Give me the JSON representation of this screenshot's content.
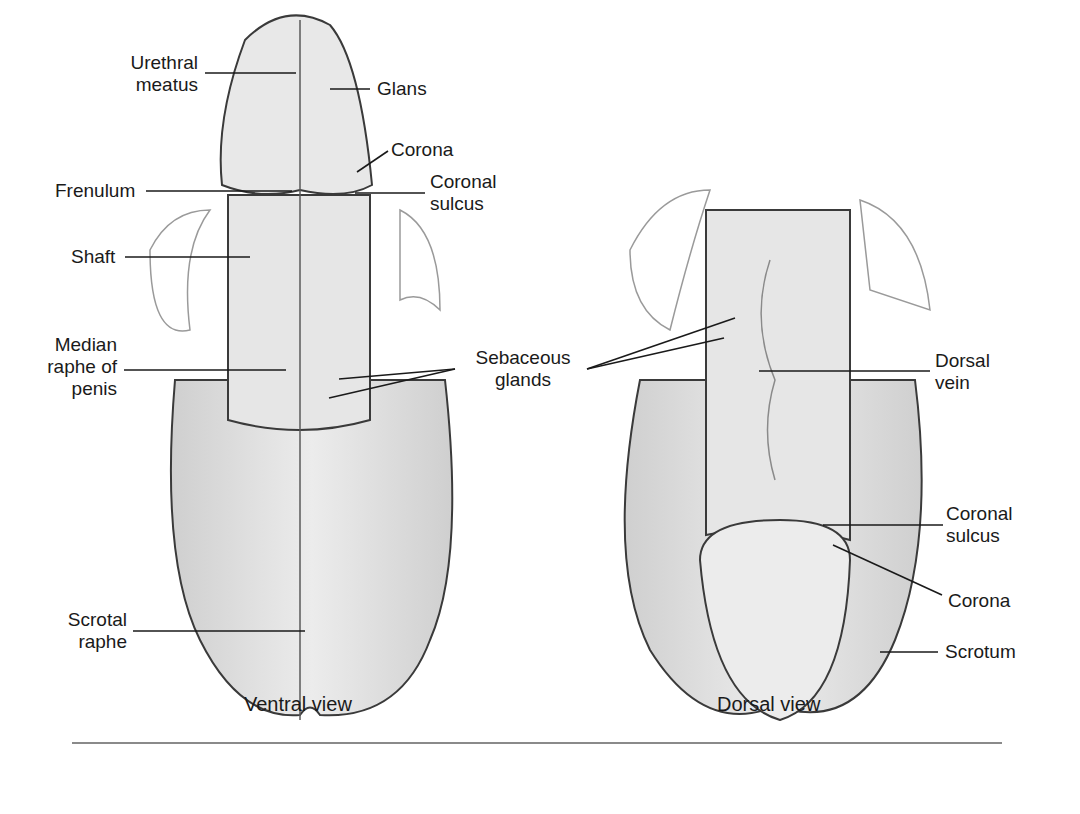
{
  "figure": {
    "type": "anatomical-illustration",
    "style": "grayscale pencil drawing",
    "views": [
      {
        "name": "Ventral view",
        "labels": {
          "urethral_meatus": "Urethral\nmeatus",
          "glans": "Glans",
          "corona": "Corona",
          "frenulum": "Frenulum",
          "coronal_sulcus": "Coronal\nsulcus",
          "shaft": "Shaft",
          "median_raphe": "Median\nraphe of\npenis",
          "scrotal_raphe": "Scrotal\nraphe"
        }
      },
      {
        "name": "Dorsal view",
        "labels": {
          "dorsal_vein": "Dorsal\nvein",
          "coronal_sulcus": "Coronal\nsulcus",
          "corona": "Corona",
          "scrotum": "Scrotum"
        }
      }
    ],
    "shared_labels": {
      "sebaceous_glands": "Sebaceous\nglands"
    },
    "colors": {
      "line": "#2a2a2a",
      "fill": "#e4e4e4",
      "shade": "#c9c9c9",
      "rule": "#8a8a8a"
    }
  }
}
